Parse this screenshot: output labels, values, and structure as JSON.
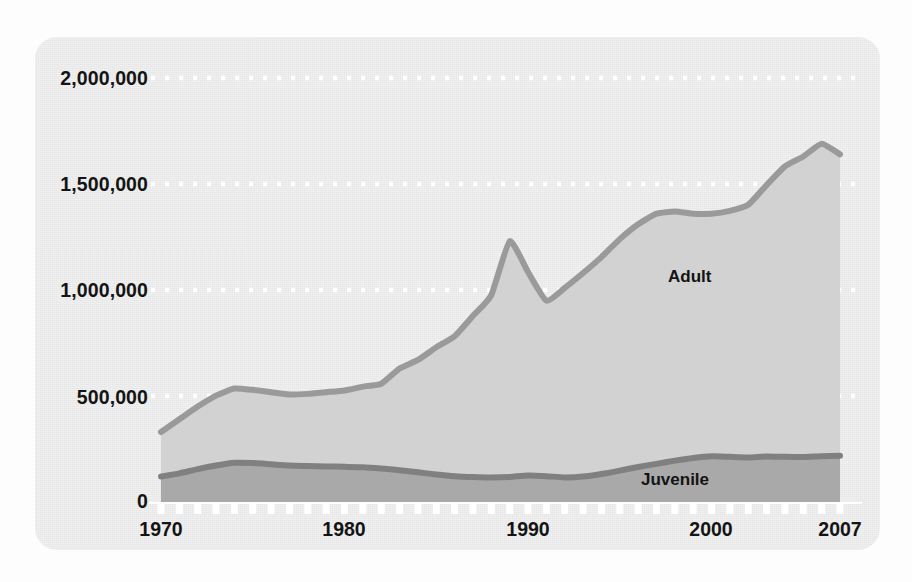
{
  "chart_data": {
    "type": "area",
    "title": "",
    "subtitle": "",
    "xlabel": "",
    "ylabel": "",
    "stacked": true,
    "grid": true,
    "grid_style": "dotted-white-horizontal",
    "legend_position": "inline-annotation",
    "xlim": [
      1970,
      2007
    ],
    "ylim": [
      0,
      2000000
    ],
    "x_ticks": [
      1970,
      1980,
      1990,
      2000,
      2007
    ],
    "x_tick_labels": [
      "1970",
      "1980",
      "1990",
      "2000",
      "2007"
    ],
    "x_minor_tick_interval": 1,
    "y_ticks": [
      0,
      500000,
      1000000,
      1500000,
      2000000
    ],
    "y_tick_labels": [
      "0",
      "500,000",
      "1,000,000",
      "1,500,000",
      "2,000,000"
    ],
    "x": [
      1970,
      1971,
      1972,
      1973,
      1974,
      1975,
      1976,
      1977,
      1978,
      1979,
      1980,
      1981,
      1982,
      1983,
      1984,
      1985,
      1986,
      1987,
      1988,
      1989,
      1990,
      1991,
      1992,
      1993,
      1994,
      1995,
      1996,
      1997,
      1998,
      1999,
      2000,
      2001,
      2002,
      2003,
      2004,
      2005,
      2006,
      2007
    ],
    "series": [
      {
        "name": "Juvenile",
        "color": "#a9a9a9",
        "line_color": "#808080",
        "values": [
          120000,
          135000,
          155000,
          172000,
          185000,
          184000,
          178000,
          172000,
          170000,
          168000,
          166000,
          164000,
          158000,
          150000,
          140000,
          130000,
          122000,
          118000,
          116000,
          118000,
          125000,
          122000,
          116000,
          120000,
          132000,
          148000,
          165000,
          180000,
          195000,
          208000,
          216000,
          213000,
          210000,
          215000,
          213000,
          212000,
          216000,
          218000
        ]
      },
      {
        "name": "Adult",
        "color": "#d2d2d2",
        "line_color": "#9a9a9a",
        "values": [
          210000,
          255000,
          295000,
          330000,
          350000,
          345000,
          340000,
          335000,
          340000,
          350000,
          360000,
          380000,
          400000,
          480000,
          530000,
          600000,
          660000,
          760000,
          860000,
          1112000,
          960000,
          828000,
          894000,
          960000,
          1023000,
          1092000,
          1145000,
          1180000,
          1175000,
          1152000,
          1144000,
          1160000,
          1192000,
          1280000,
          1370000,
          1418000,
          1474000,
          1422000
        ]
      }
    ],
    "totals": [
      330000,
      390000,
      450000,
      502000,
      535000,
      529000,
      518000,
      507000,
      510000,
      518000,
      526000,
      544000,
      558000,
      630000,
      670000,
      730000,
      782000,
      878000,
      976000,
      1230000,
      1085000,
      950000,
      1010000,
      1080000,
      1155000,
      1240000,
      1310000,
      1360000,
      1370000,
      1360000,
      1360000,
      1373000,
      1402000,
      1495000,
      1583000,
      1630000,
      1690000,
      1640000
    ],
    "annotations": [
      {
        "text": "Adult",
        "x": 1998,
        "y": 900000
      },
      {
        "text": "Juvenile",
        "x": 2000.5,
        "y": 105000
      }
    ],
    "colors": {
      "card_background": "#e7e7e7",
      "page_background": "#fdfdfd",
      "adult_fill": "#d2d2d2",
      "adult_line": "#9a9a9a",
      "juvenile_fill": "#a9a9a9",
      "juvenile_line": "#808080",
      "gridline": "#ffffff",
      "tick": "#ffffff",
      "text": "#141414"
    }
  }
}
